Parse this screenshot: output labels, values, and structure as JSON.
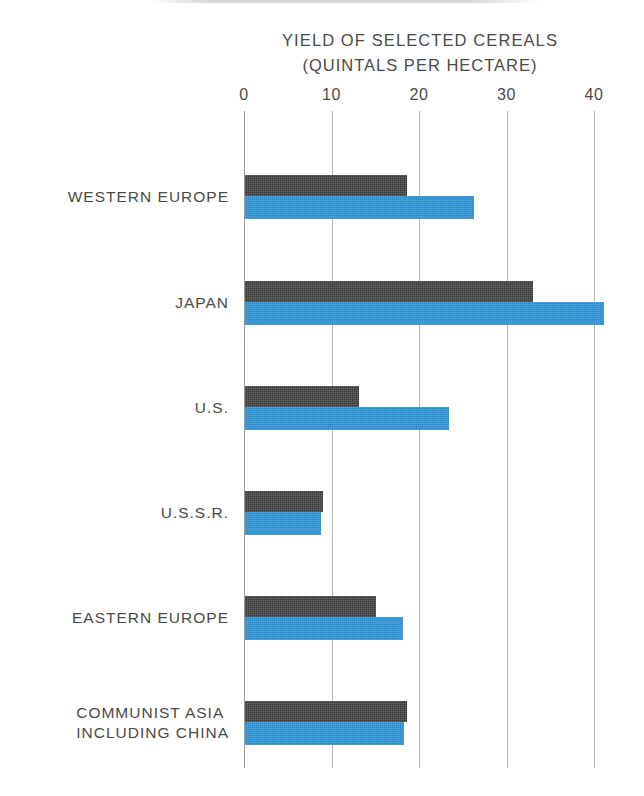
{
  "chart_data": {
    "type": "bar",
    "orientation": "horizontal",
    "title": "YIELD OF SELECTED CEREALS",
    "subtitle": "(QUINTALS PER HECTARE)",
    "xlabel": "",
    "ylabel": "",
    "xlim": [
      0,
      40
    ],
    "xticks": [
      0,
      10,
      20,
      30,
      40
    ],
    "xtick_labels": [
      "0",
      "10",
      "20",
      "30",
      "40"
    ],
    "grid": true,
    "grid_axis": "x",
    "legend": "none",
    "categories": [
      "WESTERN EUROPE",
      "JAPAN",
      "U.S.",
      "U.S.S.R.",
      "EASTERN EUROPE",
      "COMMUNIST ASIA INCLUDING CHINA"
    ],
    "series": [
      {
        "name": "dark",
        "color": "#3b3a38",
        "values": [
          18.5,
          32.9,
          13.0,
          8.9,
          15.0,
          18.5
        ]
      },
      {
        "name": "blue",
        "color": "#2d8ece",
        "values": [
          26.2,
          41.0,
          23.3,
          8.7,
          18.0,
          18.2
        ]
      }
    ]
  },
  "categories_display": [
    {
      "line1": "WESTERN EUROPE",
      "line2": ""
    },
    {
      "line1": "JAPAN",
      "line2": ""
    },
    {
      "line1": "U.S.",
      "line2": ""
    },
    {
      "line1": "U.S.S.R.",
      "line2": ""
    },
    {
      "line1": "EASTERN EUROPE",
      "line2": ""
    },
    {
      "line1": "COMMUNIST ASIA",
      "line2": "INCLUDING CHINA"
    }
  ],
  "colors": {
    "dark_bar": "#3b3a38",
    "blue_bar": "#2d8ece",
    "gridline": "#b9b7b4",
    "text": "#4a4a48",
    "background": "#ffffff"
  }
}
